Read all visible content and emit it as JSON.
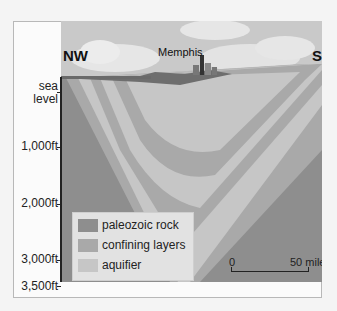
{
  "diagram": {
    "title_labels": {
      "left_direction": "NW",
      "right_direction": "SE",
      "city": "Memphis"
    },
    "depth_axis": {
      "ticks": [
        {
          "label_line1": "sea",
          "label_line2": "level"
        },
        {
          "label": "1,000ft"
        },
        {
          "label": "2,000ft"
        },
        {
          "label": "3,000ft"
        },
        {
          "label": "3,500ft"
        }
      ]
    },
    "legend": {
      "items": [
        {
          "label": "paleozoic rock",
          "color": "#8e8e8e"
        },
        {
          "label": "confining layers",
          "color": "#a9a9a9"
        },
        {
          "label": "aquifier",
          "color": "#c6c6c6"
        }
      ]
    },
    "scale_bar": {
      "start": "0",
      "end": "50 mile"
    },
    "colors": {
      "sky": "#c9c9c9",
      "cloud": "#ececec",
      "paleozoic": "#8e8e8e",
      "confining": "#a9a9a9",
      "aquifer": "#c6c6c6",
      "surface": "#6e6e6e"
    }
  }
}
